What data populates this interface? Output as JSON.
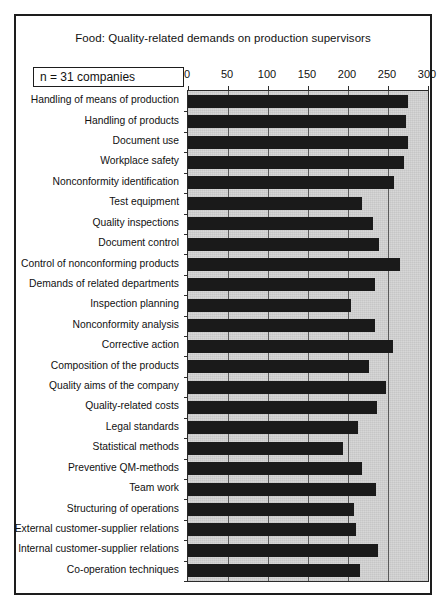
{
  "figure": {
    "title": "Food: Quality-related demands on production supervisors",
    "sample_size_note": "n = 31 companies",
    "border_color": "#1d1d1d",
    "plot_background": "#d4d4d4",
    "bar_color": "#1a1a1a"
  },
  "chart_data": {
    "type": "bar",
    "orientation": "horizontal",
    "title": "Food: Quality-related demands on production supervisors",
    "xlabel": "",
    "ylabel": "",
    "xlim": [
      0,
      300
    ],
    "xticks": [
      0,
      50,
      100,
      150,
      200,
      250,
      300
    ],
    "grid": true,
    "legend": "none",
    "annotations": [
      "n = 31 companies"
    ],
    "categories": [
      "Handling of means of production",
      "Handling of products",
      "Document use",
      "Workplace safety",
      "Nonconformity identification",
      "Test equipment",
      "Quality inspections",
      "Document control",
      "Control of nonconforming products",
      "Demands of related departments",
      "Inspection planning",
      "Nonconformity analysis",
      "Corrective action",
      "Composition of the  products",
      "Quality aims of the company",
      "Quality-related costs",
      "Legal standards",
      "Statistical methods",
      "Preventive QM-methods",
      "Team work",
      "Structuring of operations",
      "External customer-supplier relations",
      "Internal customer-supplier relations",
      "Co-operation techniques"
    ],
    "values": [
      275,
      272,
      275,
      270,
      258,
      218,
      231,
      239,
      265,
      234,
      204,
      234,
      256,
      226,
      248,
      236,
      213,
      194,
      218,
      235,
      208,
      210,
      238,
      215
    ]
  }
}
